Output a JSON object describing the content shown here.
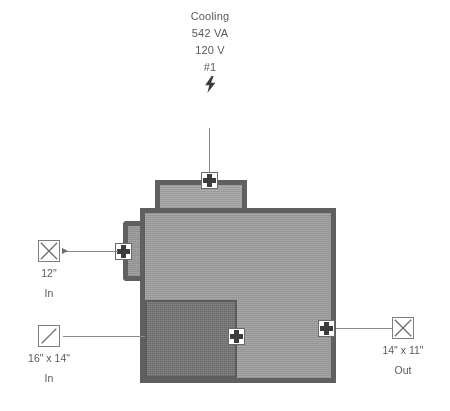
{
  "diagram": {
    "type": "hvac-equipment-schematic",
    "background_color": "#ffffff",
    "body_fill_color": "#a2a2a2",
    "body_border_color": "#606060",
    "inner_fill_color": "#787878",
    "text_color": "#5a5a5a"
  },
  "top_label": {
    "name": "Cooling",
    "power_va": "542 VA",
    "voltage": "120 V",
    "circuit": "#1",
    "electrical_icon": "lightning-bolt-icon",
    "bolt_glyph": "⚡"
  },
  "connections": [
    {
      "id": "inlet-round",
      "position": "left-upper",
      "symbol": "round-duct-icon",
      "symbol_shape": "square-with-x",
      "size": "12\"",
      "direction": "In",
      "has_arrow": true
    },
    {
      "id": "inlet-rect",
      "position": "left-lower",
      "symbol": "rectangular-duct-icon",
      "symbol_shape": "square-with-diagonal",
      "size": "16\" x 14\"",
      "direction": "In",
      "has_arrow": false
    },
    {
      "id": "outlet-rect",
      "position": "right",
      "symbol": "round-duct-icon",
      "symbol_shape": "square-with-x",
      "size": "14\" x 11\"",
      "direction": "Out",
      "has_arrow": false
    }
  ],
  "nodes": [
    {
      "id": "node-top",
      "label": "top-connection-node"
    },
    {
      "id": "node-left",
      "label": "left-connection-node"
    },
    {
      "id": "node-bottom",
      "label": "bottom-connection-node"
    },
    {
      "id": "node-right",
      "label": "right-connection-node"
    }
  ]
}
